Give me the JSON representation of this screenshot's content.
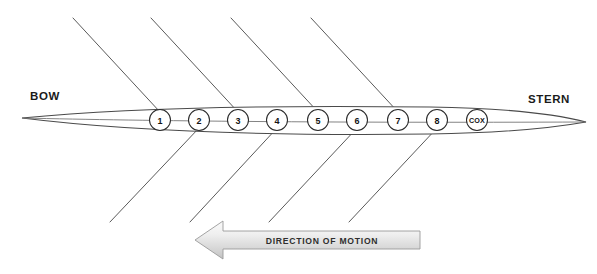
{
  "diagram": {
    "bow_label": "BOW",
    "stern_label": "STERN",
    "motion_label": "DIRECTION OF MOTION",
    "colors": {
      "background": "#ffffff",
      "hull_stroke": "#4a4a4a",
      "oar_stroke": "#5a5a5a",
      "seat_stroke": "#2a2a2a",
      "text": "#1b1b1b",
      "arrow_fill_light": "#f2f2f2",
      "arrow_fill_dark": "#c9c9c9",
      "arrow_stroke": "#9a9a9a"
    },
    "seats": [
      {
        "label": "1",
        "cx": 160,
        "cy": 120,
        "r": 10.5,
        "oar": "up"
      },
      {
        "label": "2",
        "cx": 199,
        "cy": 120,
        "r": 10.5,
        "oar": "down"
      },
      {
        "label": "3",
        "cx": 238,
        "cy": 120,
        "r": 10.5,
        "oar": "up"
      },
      {
        "label": "4",
        "cx": 277,
        "cy": 120,
        "r": 10.5,
        "oar": "down"
      },
      {
        "label": "5",
        "cx": 318,
        "cy": 120,
        "r": 10.5,
        "oar": "up"
      },
      {
        "label": "6",
        "cx": 357,
        "cy": 120,
        "r": 10.5,
        "oar": "down"
      },
      {
        "label": "7",
        "cx": 398,
        "cy": 120,
        "r": 10.5,
        "oar": "up"
      },
      {
        "label": "8",
        "cx": 437,
        "cy": 120,
        "r": 10.5,
        "oar": "down"
      },
      {
        "label": "COX",
        "cx": 477,
        "cy": 120,
        "r": 10.5,
        "oar": "none"
      }
    ],
    "oars_up": [
      {
        "x1": 73,
        "y1": 18,
        "x2": 160,
        "y2": 112
      },
      {
        "x1": 151,
        "y1": 18,
        "x2": 238,
        "y2": 112
      },
      {
        "x1": 231,
        "y1": 18,
        "x2": 318,
        "y2": 112
      },
      {
        "x1": 311,
        "y1": 18,
        "x2": 398,
        "y2": 112
      }
    ],
    "oars_down": [
      {
        "x1": 110,
        "y1": 222,
        "x2": 199,
        "y2": 128
      },
      {
        "x1": 190,
        "y1": 222,
        "x2": 277,
        "y2": 128
      },
      {
        "x1": 269,
        "y1": 222,
        "x2": 357,
        "y2": 128
      },
      {
        "x1": 349,
        "y1": 222,
        "x2": 437,
        "y2": 128
      }
    ],
    "bow_label_pos": {
      "x": 30,
      "y": 100
    },
    "stern_label_pos": {
      "x": 528,
      "y": 103
    },
    "motion_arrow": {
      "tip_x": 195,
      "tail_x": 420,
      "center_y": 240,
      "shaft_half_height": 9,
      "head_half_height": 19,
      "head_length": 28
    },
    "hull": {
      "bow_tip_x": 22,
      "stern_tip_x": 586,
      "axis_y_bow": 118,
      "axis_y_stern": 122,
      "top_y": 107,
      "bottom_y": 133
    }
  }
}
